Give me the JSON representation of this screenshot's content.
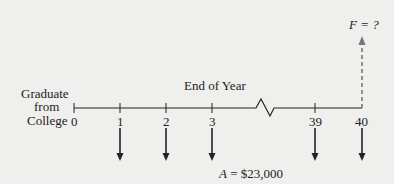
{
  "diagram": {
    "left_label": [
      "Graduate",
      "from",
      "College"
    ],
    "axis_title": "End of Year",
    "ticks": [
      "0",
      "1",
      "2",
      "3",
      "39",
      "40"
    ],
    "future_value_label": "F = ?",
    "annuity_label_var": "A",
    "annuity_label_value": "= $23,000",
    "colors": {
      "line": "#222222",
      "dashed": "#777777",
      "background": "#efefed"
    }
  }
}
